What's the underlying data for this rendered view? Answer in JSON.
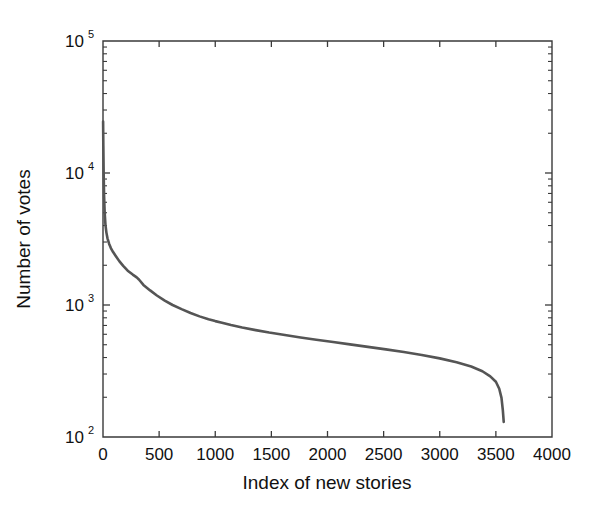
{
  "chart_data": {
    "type": "line",
    "title": "",
    "xlabel": "Index of new stories",
    "ylabel": "Number of votes",
    "xlim": [
      0,
      4000
    ],
    "ylim": [
      100,
      100000
    ],
    "yscale": "log",
    "xscale": "linear",
    "grid": false,
    "legend": null,
    "xticks": [
      0,
      500,
      1000,
      1500,
      2000,
      2500,
      3000,
      3500,
      4000
    ],
    "xticklabels": [
      "0",
      "500",
      "1000",
      "1500",
      "2000",
      "2500",
      "3000",
      "3500",
      "4000"
    ],
    "yticks": [
      100,
      1000,
      10000,
      100000
    ],
    "yticklabels": [
      "10^2",
      "10^3",
      "10^4",
      "10^5"
    ],
    "ytick_mantissas": [
      "10",
      "10",
      "10",
      "10"
    ],
    "ytick_exponents": [
      "2",
      "3",
      "4",
      "5"
    ],
    "series": [
      {
        "name": "votes",
        "color": "#555555",
        "x": [
          1,
          3,
          6,
          10,
          15,
          22,
          30,
          40,
          55,
          70,
          90,
          115,
          145,
          180,
          220,
          265,
          300,
          320,
          360,
          420,
          480,
          550,
          620,
          700,
          780,
          860,
          940,
          1000,
          1060,
          1140,
          1240,
          1360,
          1480,
          1620,
          1760,
          1900,
          2050,
          2200,
          2360,
          2520,
          2680,
          2840,
          3000,
          3150,
          3280,
          3380,
          3450,
          3500,
          3530,
          3550,
          3562,
          3570
        ],
        "y": [
          24500,
          16000,
          9800,
          6600,
          5000,
          4050,
          3550,
          3200,
          2900,
          2700,
          2520,
          2340,
          2150,
          1980,
          1820,
          1700,
          1620,
          1560,
          1420,
          1290,
          1180,
          1080,
          1000,
          930,
          870,
          820,
          780,
          755,
          735,
          705,
          675,
          645,
          618,
          592,
          568,
          546,
          524,
          503,
          482,
          461,
          440,
          418,
          394,
          368,
          342,
          315,
          288,
          262,
          232,
          198,
          160,
          130
        ]
      }
    ],
    "annotations": []
  },
  "figure": {
    "background_color": "#ffffff",
    "axis_color": "#3a3a3a",
    "text_color": "#111111",
    "curve_color": "#555555"
  }
}
